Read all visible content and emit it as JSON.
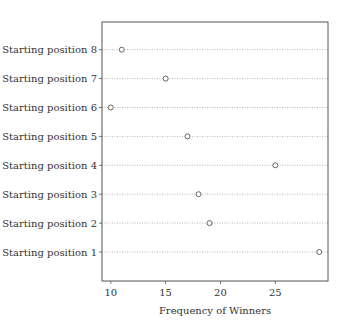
{
  "chart_data": {
    "type": "scatter",
    "subtype": "dot-plot",
    "title": "",
    "xlabel": "Frequency of Winners",
    "ylabel": "",
    "categories": [
      "Starting position 1",
      "Starting position 2",
      "Starting position 3",
      "Starting position 4",
      "Starting position 5",
      "Starting position 6",
      "Starting position 7",
      "Starting position 8"
    ],
    "values": [
      29,
      19,
      18,
      25,
      17,
      10,
      15,
      11
    ],
    "xlim": [
      9.2,
      29.8
    ],
    "xticks": [
      10,
      15,
      20,
      25
    ],
    "xtick_labels": [
      "10",
      "15",
      "20",
      "25"
    ],
    "grid": "horizontal dotted",
    "legend": "none",
    "marker": "open circle"
  },
  "colors": {
    "axis": "#555555",
    "grid": "#999999",
    "marker": "#555555",
    "text": "#333333"
  }
}
